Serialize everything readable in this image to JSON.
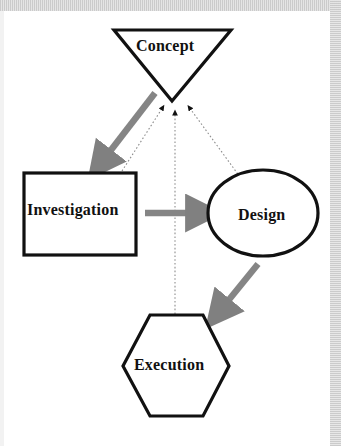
{
  "diagram": {
    "background_color": "#ffffff",
    "outline_color": "#111111",
    "arrow_color": "#808080",
    "feedback_line_color": "#999999",
    "nodes": [
      {
        "id": "concept",
        "label": "Concept",
        "shape": "inverted-triangle"
      },
      {
        "id": "investigation",
        "label": "Investigation",
        "shape": "rectangle"
      },
      {
        "id": "design",
        "label": "Design",
        "shape": "ellipse"
      },
      {
        "id": "execution",
        "label": "Execution",
        "shape": "hexagon"
      }
    ],
    "forward_arrows": [
      {
        "from": "concept",
        "to": "investigation",
        "style": "solid-gray"
      },
      {
        "from": "investigation",
        "to": "design",
        "style": "solid-gray"
      },
      {
        "from": "design",
        "to": "execution",
        "style": "solid-gray"
      }
    ],
    "feedback_arrows": [
      {
        "from": "investigation",
        "to": "concept",
        "style": "dotted"
      },
      {
        "from": "execution",
        "to": "concept",
        "style": "dotted"
      },
      {
        "from": "design",
        "to": "concept",
        "style": "dotted"
      }
    ]
  }
}
